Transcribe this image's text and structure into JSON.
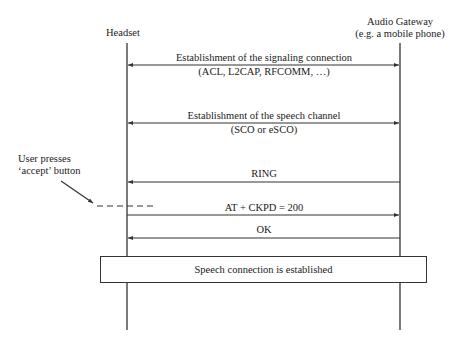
{
  "participants": {
    "headset": {
      "label": "Headset"
    },
    "gateway": {
      "label_line1": "Audio Gateway",
      "label_line2": "(e.g. a mobile phone)"
    }
  },
  "messages": [
    {
      "id": "signaling",
      "direction": "bidirectional",
      "label_line1": "Establishment of the signaling connection",
      "label_line2": "(ACL, L2CAP, RFCOMM, …)"
    },
    {
      "id": "speech-channel",
      "direction": "bidirectional",
      "label_line1": "Establishment of the speech channel",
      "label_line2": "(SCO or eSCO)"
    },
    {
      "id": "ring",
      "direction": "gateway-to-headset",
      "label": "RING"
    },
    {
      "id": "ckpd",
      "direction": "headset-to-gateway",
      "label": "AT + CKPD = 200"
    },
    {
      "id": "ok",
      "direction": "gateway-to-headset",
      "label": "OK"
    }
  ],
  "annotation": {
    "line1": "User presses",
    "line2": "‘accept’ button"
  },
  "result_box": {
    "label": "Speech connection is established"
  },
  "colors": {
    "line": "#333333",
    "text": "#222222",
    "background": "#ffffff"
  }
}
